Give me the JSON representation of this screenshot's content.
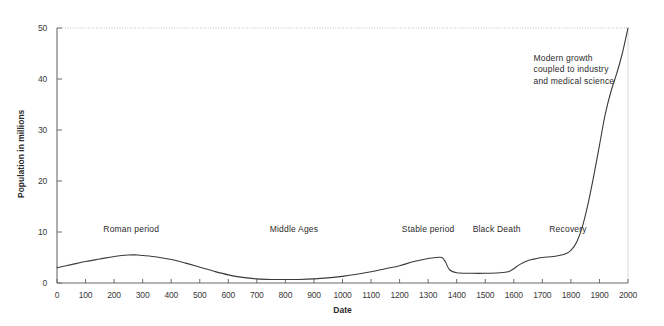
{
  "chart_data": {
    "type": "line",
    "title": "",
    "xlabel": "Date",
    "ylabel": "Population in millions",
    "xlim": [
      0,
      2000
    ],
    "ylim": [
      0,
      50
    ],
    "grid": "top-dotted-only",
    "legend": "none",
    "x_ticks": [
      0,
      100,
      200,
      300,
      400,
      500,
      600,
      700,
      800,
      900,
      1000,
      1100,
      1200,
      1300,
      1400,
      1500,
      1600,
      1700,
      1800,
      1900,
      2000
    ],
    "y_ticks": [
      0,
      10,
      20,
      30,
      40,
      50
    ],
    "series": [
      {
        "name": "Population",
        "x": [
          0,
          50,
          100,
          150,
          200,
          250,
          280,
          300,
          350,
          400,
          450,
          500,
          550,
          600,
          650,
          700,
          750,
          800,
          850,
          900,
          950,
          1000,
          1050,
          1100,
          1150,
          1200,
          1250,
          1300,
          1330,
          1348,
          1360,
          1375,
          1400,
          1450,
          1500,
          1550,
          1580,
          1600,
          1620,
          1650,
          1680,
          1700,
          1750,
          1780,
          1800,
          1820,
          1840,
          1860,
          1880,
          1900,
          1920,
          1940,
          1960,
          1980,
          2000
        ],
        "values": [
          3.0,
          3.6,
          4.2,
          4.7,
          5.2,
          5.5,
          5.5,
          5.4,
          5.1,
          4.6,
          3.9,
          3.1,
          2.3,
          1.6,
          1.1,
          0.8,
          0.7,
          0.7,
          0.7,
          0.8,
          1.0,
          1.3,
          1.7,
          2.2,
          2.8,
          3.4,
          4.2,
          4.8,
          5.0,
          5.0,
          4.2,
          2.6,
          2.0,
          1.9,
          1.9,
          2.0,
          2.2,
          2.8,
          3.6,
          4.4,
          4.8,
          5.0,
          5.3,
          5.7,
          6.4,
          8.0,
          11.0,
          15.5,
          21.0,
          27.0,
          33.0,
          37.5,
          41.0,
          45.0,
          50.0
        ]
      }
    ],
    "annotations": [
      {
        "label": "Roman period",
        "x_value": 260,
        "y_value": 10.6
      },
      {
        "label": "Middle Ages",
        "x_value": 830,
        "y_value": 10.6
      },
      {
        "label": "Stable period",
        "x_value": 1300,
        "y_value": 10.6
      },
      {
        "label": "Black Death",
        "x_value": 1540,
        "y_value": 10.6
      },
      {
        "label": "Recovery",
        "x_value": 1790,
        "y_value": 10.6
      },
      {
        "label": "Modern growth coupled to industry and medical science",
        "x_value": 1830,
        "y_value": 44.0
      }
    ]
  },
  "axis": {
    "x_title": "Date",
    "y_title": "Population in millions",
    "x_tick_labels": [
      "0",
      "100",
      "200",
      "300",
      "400",
      "500",
      "600",
      "700",
      "800",
      "900",
      "1000",
      "1100",
      "1200",
      "1300",
      "1400",
      "1500",
      "1600",
      "1700",
      "1800",
      "1900",
      "2000"
    ],
    "y_tick_labels": [
      "0",
      "10",
      "20",
      "30",
      "40",
      "50"
    ]
  },
  "colors": {
    "line": "#3a3a3a",
    "axis": "#6b6b6b",
    "grid": "#b9b9b9",
    "background": "#ffffff",
    "text": "#2b2b2b"
  }
}
